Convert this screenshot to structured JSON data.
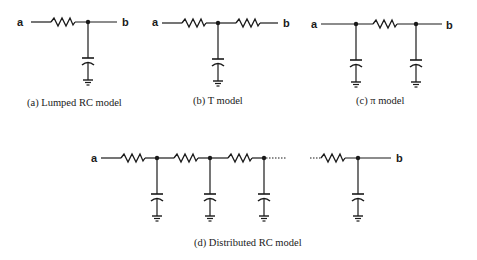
{
  "figure": {
    "panels": [
      {
        "id": "a",
        "caption": "(a) Lumped RC model",
        "terminal_in": "a",
        "terminal_out": "b",
        "components": [
          "resistor",
          "capacitor-to-ground"
        ]
      },
      {
        "id": "b",
        "caption": "(b) T model",
        "terminal_in": "a",
        "terminal_out": "b",
        "components": [
          "resistor",
          "capacitor-to-ground",
          "resistor"
        ]
      },
      {
        "id": "c",
        "caption": "(c) π model",
        "terminal_in": "a",
        "terminal_out": "b",
        "components": [
          "capacitor-to-ground",
          "resistor",
          "capacitor-to-ground"
        ]
      },
      {
        "id": "d",
        "caption": "(d) Distributed RC model",
        "terminal_in": "a",
        "terminal_out": "b",
        "components": [
          "resistor",
          "capacitor-to-ground",
          "resistor",
          "capacitor-to-ground",
          "resistor",
          "capacitor-to-ground",
          "ellipsis",
          "resistor",
          "capacitor-to-ground"
        ]
      }
    ]
  }
}
